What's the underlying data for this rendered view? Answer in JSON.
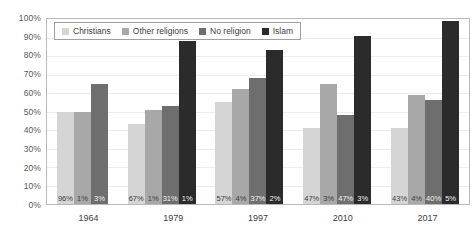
{
  "chart_data": {
    "type": "bar",
    "title": "",
    "subtitle": "",
    "xlabel": "",
    "ylabel": "",
    "ylim": [
      0,
      100
    ],
    "grid": true,
    "legend_position": "top-left-inside",
    "categories": [
      "1964",
      "1979",
      "1997",
      "2010",
      "2017"
    ],
    "ytick_labels": [
      "100%",
      "90%",
      "80%",
      "70%",
      "60%",
      "50%",
      "40%",
      "30%",
      "20%",
      "10%",
      "0%"
    ],
    "ytick_values": [
      100,
      90,
      80,
      70,
      60,
      50,
      40,
      30,
      20,
      10,
      0
    ],
    "series": [
      {
        "name": "Christians",
        "color": "#d5d5d5",
        "values": [
          50,
          43,
          55,
          41,
          41
        ],
        "data_labels": [
          "96%",
          "67%",
          "57%",
          "47%",
          "43%"
        ]
      },
      {
        "name": "Other religions",
        "color": "#a8a8a8",
        "values": [
          50,
          51,
          62,
          65,
          59
        ],
        "data_labels": [
          "1%",
          "1%",
          "4%",
          "3%",
          "4%"
        ]
      },
      {
        "name": "No religion",
        "color": "#6e6e6e",
        "values": [
          65,
          53,
          68,
          48,
          56
        ],
        "data_labels": [
          "3%",
          "31%",
          "37%",
          "47%",
          "40%"
        ]
      },
      {
        "name": "Islam",
        "color": "#2b2b2b",
        "values": [
          null,
          88,
          83,
          91,
          99
        ],
        "data_labels": [
          null,
          "1%",
          "2%",
          "3%",
          "5%"
        ]
      }
    ]
  },
  "legend": {
    "items": [
      {
        "label": "Christians",
        "color": "#d5d5d5"
      },
      {
        "label": "Other religions",
        "color": "#a8a8a8"
      },
      {
        "label": "No religion",
        "color": "#6e6e6e"
      },
      {
        "label": "Islam",
        "color": "#2b2b2b"
      }
    ]
  }
}
